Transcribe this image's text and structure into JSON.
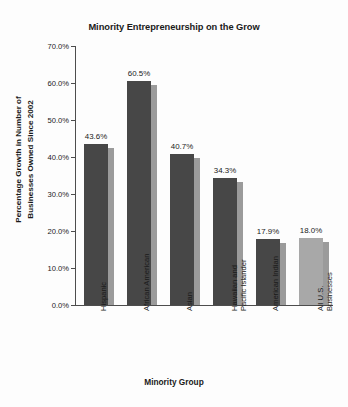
{
  "chart_data": {
    "type": "bar",
    "title": "Minority Entrepreneurship on the Grow",
    "xlabel": "Minority Group",
    "ylabel": "Percentage Growth in Number of Businesses Owned Since 2002",
    "ylabel_line1": "Percentage Growth in Number of",
    "ylabel_line2": "Businesses Owned Since 2002",
    "categories": [
      "Hispanic",
      "African American",
      "Asian",
      "Hawaiian and Pacific Islander",
      "American Indian",
      "All U.S. Businesses"
    ],
    "values": [
      43.6,
      60.5,
      40.7,
      34.3,
      17.9,
      18.0
    ],
    "data_labels": [
      "43.6%",
      "60.5%",
      "40.7%",
      "34.3%",
      "17.9%",
      "18.0%"
    ],
    "ylim": [
      0,
      70
    ],
    "ytick_values": [
      70,
      60,
      50,
      40,
      30,
      20,
      10,
      0
    ],
    "ytick_labels": [
      "70.0%",
      "60.0%",
      "50.0%",
      "40.0%",
      "30.0%",
      "20.0%",
      "10.0%",
      "0.0%"
    ],
    "grid": false,
    "legend": "none",
    "bar_colors": [
      "#474747",
      "#474747",
      "#474747",
      "#474747",
      "#474747",
      "#a8a8a8"
    ],
    "shadow_color": "#9b9b9b",
    "axis_color": "#4d4d4d",
    "background": "#fdfdfd"
  },
  "categories_display": [
    {
      "line1": "Hispanic",
      "line2": ""
    },
    {
      "line1": "African American",
      "line2": ""
    },
    {
      "line1": "Asian",
      "line2": ""
    },
    {
      "line1": "Hawaiian and",
      "line2": "Pacific Islander"
    },
    {
      "line1": "American Indian",
      "line2": ""
    },
    {
      "line1": "All U.S.",
      "line2": "Businesses"
    }
  ]
}
